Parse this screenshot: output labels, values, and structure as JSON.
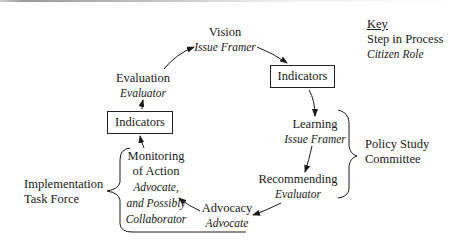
{
  "diagram": {
    "steps": {
      "vision": {
        "step": "Vision",
        "role": "Issue Framer"
      },
      "indicators_right": {
        "label": "Indicators"
      },
      "learning": {
        "step": "Learning",
        "role": "Issue Framer"
      },
      "recommending": {
        "step": "Recommending",
        "role": "Evaluator"
      },
      "advocacy": {
        "step": "Advocacy",
        "role": "Advocate"
      },
      "monitoring": {
        "step_line1": "Monitoring",
        "step_line2": "of Action",
        "role_line1": "Advocate,",
        "role_line2": "and Possibly",
        "role_line3": "Collaborator"
      },
      "indicators_left": {
        "label": "Indicators"
      },
      "evaluation": {
        "step": "Evaluation",
        "role": "Evaluator"
      }
    },
    "groups": {
      "policy": {
        "line1": "Policy Study",
        "line2": "Committee"
      },
      "implementation": {
        "line1": "Implementation",
        "line2": "Task Force"
      }
    },
    "key": {
      "title": "Key",
      "step_label": "Step in Process",
      "role_label": "Citizen Role"
    }
  }
}
